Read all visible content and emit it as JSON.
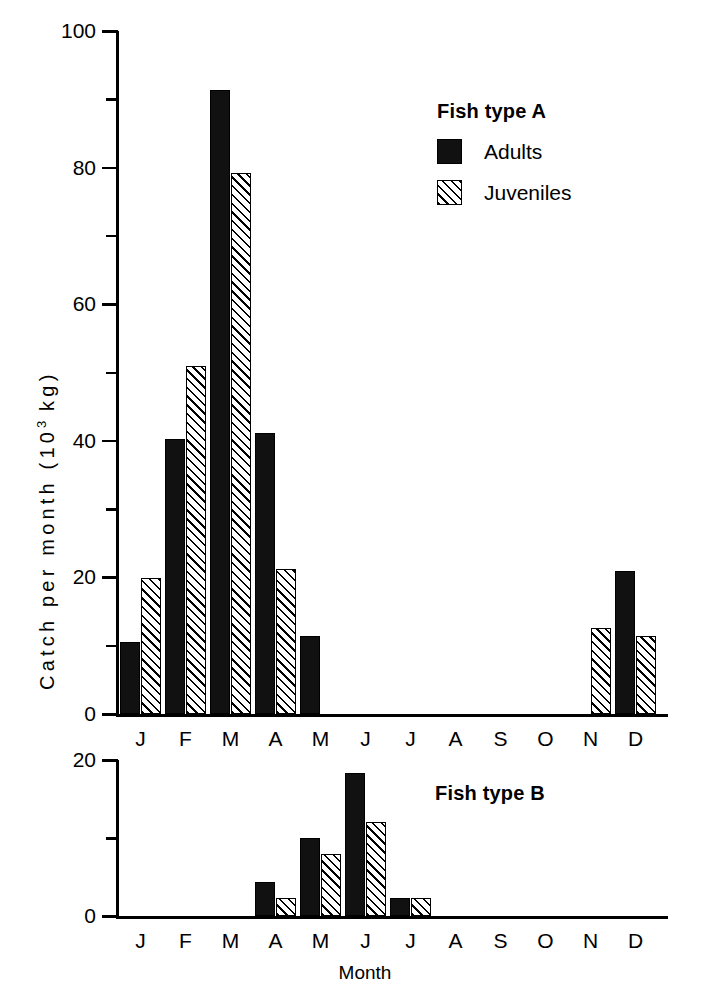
{
  "figure": {
    "y_axis_title_prefix": "Catch per month (10",
    "y_axis_title_exp": "3",
    "y_axis_title_suffix": " kg)",
    "x_axis_title": "Month"
  },
  "legend": {
    "title": "Fish type  A",
    "adults_label": "Adults",
    "juveniles_label": "Juveniles",
    "adults_color": "#111111",
    "juveniles_color": "#ffffff"
  },
  "panel_b": {
    "title": "Fish type  B"
  },
  "chart_data": [
    {
      "type": "bar",
      "title": "Fish type  A",
      "xlabel": "",
      "ylabel": "Catch per month (10^3 kg)",
      "ylim": [
        0,
        100
      ],
      "yticks": [
        0,
        20,
        40,
        60,
        80,
        100
      ],
      "yticklabels": [
        "0",
        "20",
        "40",
        "60",
        "80",
        "100"
      ],
      "yminorticks": [
        10,
        30,
        50,
        70,
        90
      ],
      "grid": false,
      "legend": "upper right",
      "categories": [
        "J",
        "F",
        "M",
        "A",
        "M",
        "J",
        "J",
        "A",
        "S",
        "O",
        "N",
        "D"
      ],
      "series": [
        {
          "name": "Adults",
          "values": [
            10.5,
            40.2,
            91.3,
            41.2,
            11.4,
            0,
            0,
            0,
            0,
            0,
            0,
            21.0
          ]
        },
        {
          "name": "Juveniles",
          "values": [
            19.9,
            51.0,
            79.2,
            21.2,
            0,
            0,
            0,
            0,
            0,
            0,
            12.6,
            11.4
          ]
        }
      ]
    },
    {
      "type": "bar",
      "title": "Fish type  B",
      "xlabel": "Month",
      "ylabel": "",
      "ylim": [
        0,
        20
      ],
      "yticks": [
        0,
        20
      ],
      "yticklabels": [
        "0",
        "20"
      ],
      "yminorticks": [
        10
      ],
      "grid": false,
      "categories": [
        "J",
        "F",
        "M",
        "A",
        "M",
        "J",
        "J",
        "A",
        "S",
        "O",
        "N",
        "D"
      ],
      "series": [
        {
          "name": "Adults",
          "values": [
            0,
            0,
            0,
            4.3,
            10.0,
            18.3,
            2.3,
            0,
            0,
            0,
            0,
            0
          ]
        },
        {
          "name": "Juveniles",
          "values": [
            0,
            0,
            0,
            2.3,
            7.9,
            12.0,
            2.3,
            0,
            0,
            0,
            0,
            0
          ]
        }
      ]
    }
  ]
}
